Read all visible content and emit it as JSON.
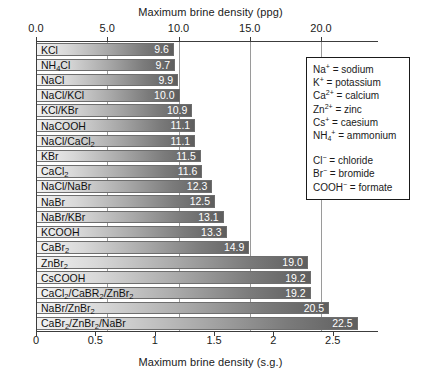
{
  "chart_data": {
    "type": "bar",
    "orientation": "horizontal",
    "title_top": "Maximum brine density (ppg)",
    "title_bottom": "Maximum brine density (s.g.)",
    "xlabel": "Maximum brine density (ppg)",
    "ylabel": "",
    "grid": true,
    "legend_position": "right",
    "xlim_ppg": [
      0.0,
      24.0
    ],
    "xlim_sg": [
      0.0,
      2.88
    ],
    "top_axis": {
      "label": "Maximum brine density (ppg)",
      "ticks": [
        0.0,
        5.0,
        10.0,
        15.0,
        20.0
      ],
      "tick_labels": [
        "0.0",
        "5.0",
        "10.0",
        "15.0",
        "20.0"
      ]
    },
    "bottom_axis": {
      "label": "Maximum brine density (s.g.)",
      "ticks": [
        0,
        0.5,
        1,
        1.5,
        2,
        2.5
      ],
      "tick_labels": [
        "0",
        "0.5",
        "1",
        "1.5",
        "2",
        "2.5"
      ]
    },
    "categories": [
      "KCl",
      "NH4Cl",
      "NaCl",
      "NaCl/KCl",
      "KCl/KBr",
      "NaCOOH",
      "NaCl/CaCl2",
      "KBr",
      "CaCl2",
      "NaCl/NaBr",
      "NaBr",
      "NaBr/KBr",
      "KCOOH",
      "CaBr2",
      "ZnBr2",
      "CsCOOH",
      "CaCl2/CaBR2/ZnBr2",
      "NaBr/ZnBr2",
      "CaBr2/ZnBr2/NaBr"
    ],
    "values": [
      9.6,
      9.7,
      9.9,
      10.0,
      10.9,
      11.1,
      11.1,
      11.5,
      11.6,
      12.3,
      12.5,
      13.1,
      13.3,
      14.9,
      19.0,
      19.2,
      19.2,
      20.5,
      22.5
    ],
    "value_labels": [
      "9.6",
      "9.7",
      "9.9",
      "10.0",
      "10.9",
      "11.1",
      "11.1",
      "11.5",
      "11.6",
      "12.3",
      "12.5",
      "13.1",
      "13.3",
      "14.9",
      "19.0",
      "19.2",
      "19.2",
      "20.5",
      "22.5"
    ],
    "bars": [
      {
        "label_html": "KCl",
        "value": 9.6,
        "value_label": "9.6"
      },
      {
        "label_html": "NH<sub>4</sub>Cl",
        "value": 9.7,
        "value_label": "9.7"
      },
      {
        "label_html": "NaCl",
        "value": 9.9,
        "value_label": "9.9"
      },
      {
        "label_html": "NaCl/KCl",
        "value": 10.0,
        "value_label": "10.0"
      },
      {
        "label_html": "KCl/KBr",
        "value": 10.9,
        "value_label": "10.9"
      },
      {
        "label_html": "NaCOOH",
        "value": 11.1,
        "value_label": "11.1"
      },
      {
        "label_html": "NaCl/CaCl<sub>2</sub>",
        "value": 11.1,
        "value_label": "11.1"
      },
      {
        "label_html": "KBr",
        "value": 11.5,
        "value_label": "11.5"
      },
      {
        "label_html": "CaCl<sub>2</sub>",
        "value": 11.6,
        "value_label": "11.6"
      },
      {
        "label_html": "NaCl/NaBr",
        "value": 12.3,
        "value_label": "12.3"
      },
      {
        "label_html": "NaBr",
        "value": 12.5,
        "value_label": "12.5"
      },
      {
        "label_html": "NaBr/KBr",
        "value": 13.1,
        "value_label": "13.1"
      },
      {
        "label_html": "KCOOH",
        "value": 13.3,
        "value_label": "13.3"
      },
      {
        "label_html": "CaBr<sub>2</sub>",
        "value": 14.9,
        "value_label": "14.9"
      },
      {
        "label_html": "ZnBr<sub>2</sub>",
        "value": 19.0,
        "value_label": "19.0"
      },
      {
        "label_html": "CsCOOH",
        "value": 19.2,
        "value_label": "19.2"
      },
      {
        "label_html": "CaCl<sub>2</sub>/CaBR<sub>2</sub>/ZnBr<sub>2</sub>",
        "value": 19.2,
        "value_label": "19.2"
      },
      {
        "label_html": "NaBr/ZnBr<sub>2</sub>",
        "value": 20.5,
        "value_label": "20.5"
      },
      {
        "label_html": "CaBr<sub>2</sub>/ZnBr<sub>2</sub>/NaBr",
        "value": 22.5,
        "value_label": "22.5"
      }
    ],
    "gridlines_ppg": [
      5.0,
      10.0,
      15.0,
      20.0
    ],
    "colors": {
      "bar_gradient_start": "#f2f2f2",
      "bar_gradient_end": "#5e5e5e",
      "bar_border": "#6e6e6e",
      "value_text": "#ffffff",
      "axis": "#3c3c3c",
      "gridline": "#9a9a9a",
      "text": "#1a1a1a",
      "background": "#ffffff"
    }
  },
  "legend": {
    "cations": [
      "Na<sup>+</sup> = sodium",
      "K<sup>+</sup> = potassium",
      "Ca<sup>2+</sup> = calcium",
      "Zn<sup>2+</sup> = zinc",
      "Cs<sup>+</sup> = caesium",
      "NH<sub>4</sub><sup>+</sup> = ammonium"
    ],
    "anions": [
      "Cl<sup>&#8722;</sup> = chloride",
      "Br<sup>&#8722;</sup> = bromide",
      "COOH<sup>&#8722;</sup> = formate"
    ]
  }
}
